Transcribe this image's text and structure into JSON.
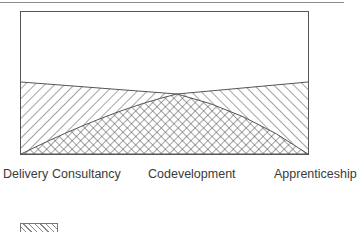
{
  "diagram": {
    "type": "stacked-area-diagram",
    "regions": [
      {
        "name": "upper-blank",
        "fill": "none"
      },
      {
        "name": "diagonal-hatch-left",
        "fill": "hatch-forward"
      },
      {
        "name": "diagonal-hatch-right",
        "fill": "hatch-backward"
      },
      {
        "name": "cross-hatch-center",
        "fill": "crosshatch"
      }
    ],
    "x_labels": [
      "Delivery",
      "Consultancy",
      "Codevelopment",
      "Apprenticeship"
    ],
    "colors": {
      "line": "#555555",
      "hatch": "#4a4a4a",
      "text": "#3a3a3a",
      "background": "#ffffff"
    }
  }
}
